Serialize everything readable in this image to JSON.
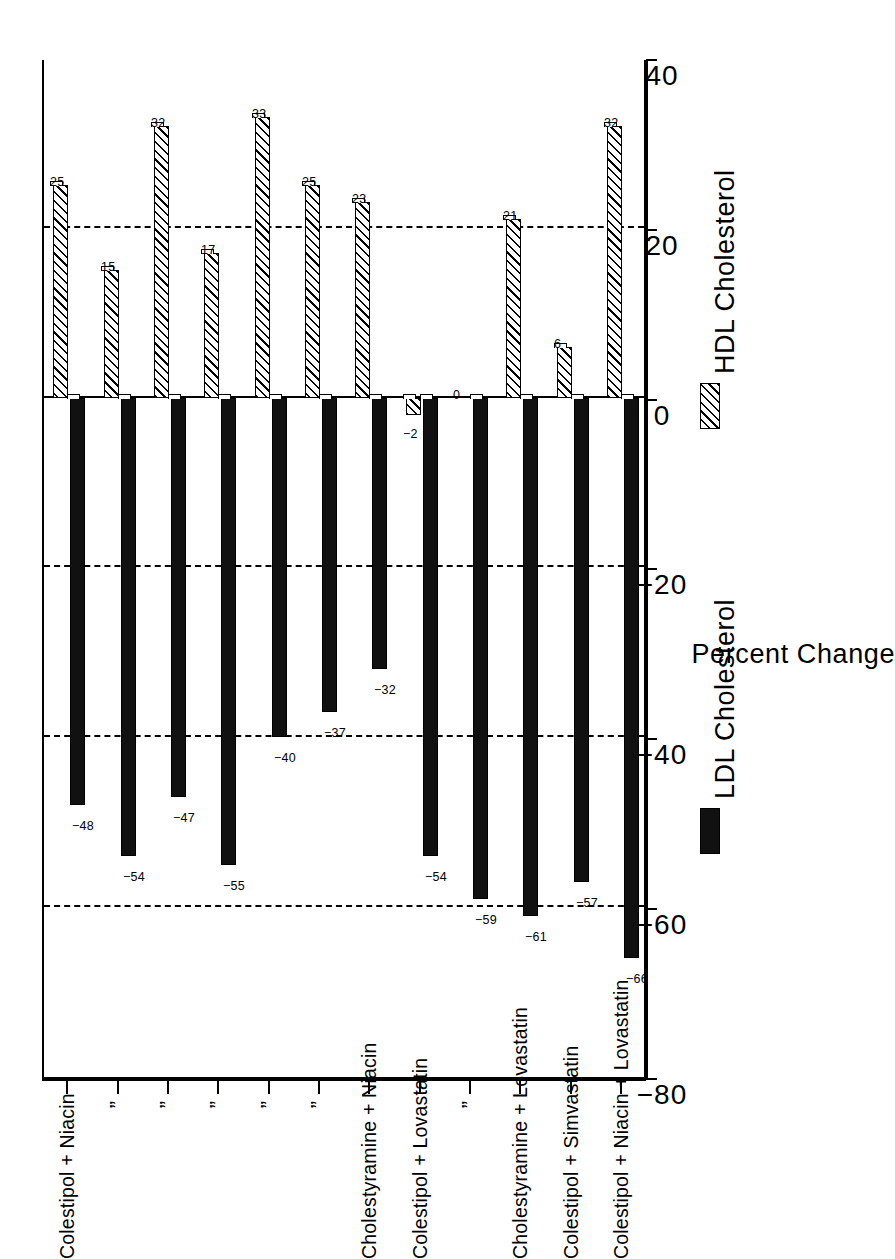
{
  "chart_data": {
    "type": "bar",
    "title": "",
    "subtitle": "",
    "orientation": "vertical-rendered-rotated",
    "xlabel": "",
    "ylabel": "Percent Change",
    "ylim": [
      -80,
      40
    ],
    "yticks": [
      40,
      20,
      0,
      -20,
      -40,
      -60,
      -80
    ],
    "ytick_labels": [
      "40",
      "20",
      "0",
      "−20",
      "−40",
      "−60",
      "−80"
    ],
    "grid": "dashed horizontal gridlines at 20, -20, -40, -60",
    "gridlines": [
      20,
      -20,
      -40,
      -60
    ],
    "legend_position": "right",
    "categories": [
      "Colestipol + Niacin",
      "”",
      "”",
      "”",
      "”",
      "”",
      "Cholestyramine + Niacin",
      "Colestipol + Lovastatin",
      "”",
      "Cholestyramine + Lovastatin",
      "Colestipol + Simvastatin",
      "Colestipol + Niacin + Lovastatin"
    ],
    "series": [
      {
        "name": "LDL Cholesterol",
        "fill": "solid-black",
        "color": "#111111",
        "values": [
          -48,
          -54,
          -47,
          -55,
          -40,
          -37,
          -32,
          -54,
          -59,
          -61,
          -57,
          -66
        ],
        "value_labels": [
          "−48",
          "−54",
          "−47",
          "−55",
          "−40",
          "−37",
          "−32",
          "−54",
          "−59",
          "−61",
          "−57",
          "−66"
        ]
      },
      {
        "name": "HDL Cholesterol",
        "fill": "diagonal-hatch",
        "color": "#ffffff",
        "values": [
          25,
          15,
          32,
          17,
          33,
          25,
          23,
          -2,
          0,
          21,
          6,
          32
        ],
        "value_labels": [
          "25",
          "15",
          "32",
          "17",
          "33",
          "25",
          "23",
          "−2",
          "0",
          "21",
          "6",
          "32"
        ]
      }
    ]
  },
  "axis": {
    "value_axis_title": "Percent Change"
  },
  "legend": {
    "items": [
      {
        "label": "LDL Cholesterol",
        "style": "solid-black"
      },
      {
        "label": "HDL Cholesterol",
        "style": "diagonal-hatch"
      }
    ]
  }
}
